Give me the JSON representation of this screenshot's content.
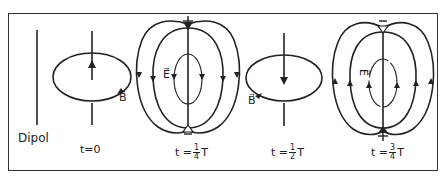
{
  "diagram": {
    "type": "oscillating electric dipole field phases",
    "colors": {
      "line": "#222222",
      "background": "#ffffff",
      "frame": "#333333"
    },
    "panels": [
      {
        "id": "dipol",
        "label": "Dipol"
      },
      {
        "id": "t0",
        "time_label": {
          "prefix": "t=",
          "value": "0",
          "suffix": ""
        },
        "field_label": "B⃗",
        "field": "magnetic",
        "current_arrow": "up"
      },
      {
        "id": "t14",
        "time_label": {
          "prefix": "t =",
          "num": "1",
          "den": "4",
          "suffix": "T"
        },
        "field_label": "E⃗",
        "field": "electric",
        "top_charge": "+",
        "bottom_charge": "−",
        "loop_arrows": "down-outer"
      },
      {
        "id": "t12",
        "time_label": {
          "prefix": "t =",
          "num": "1",
          "den": "2",
          "suffix": "T"
        },
        "field_label": "B⃗",
        "field": "magnetic",
        "current_arrow": "down"
      },
      {
        "id": "t34",
        "time_label": {
          "prefix": "t =",
          "num": "3",
          "den": "4",
          "suffix": "T"
        },
        "field_label": "E⃗",
        "field": "electric",
        "top_charge": "−",
        "bottom_charge": "+",
        "loop_arrows": "up-outer"
      }
    ]
  }
}
